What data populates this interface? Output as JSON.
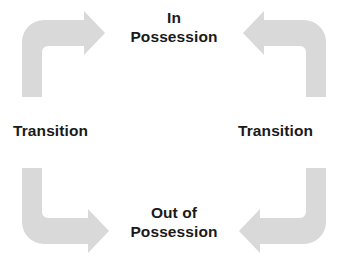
{
  "diagram": {
    "type": "cycle-diagram",
    "background_color": "#ffffff",
    "arrow_color": "#d9d9d9",
    "text_color": "#1a1a1a",
    "nodes": [
      {
        "id": "in-possession",
        "label": "In\nPossession",
        "position": "top-center"
      },
      {
        "id": "transition-right",
        "label": "Transition",
        "position": "middle-right"
      },
      {
        "id": "out-of-possession",
        "label": "Out of\nPossession",
        "position": "bottom-center"
      },
      {
        "id": "transition-left",
        "label": "Transition",
        "position": "middle-left"
      }
    ],
    "arrows": [
      {
        "id": "arrow-top-left",
        "from": "transition-left",
        "to": "in-possession",
        "direction": "up-then-right",
        "head": "right"
      },
      {
        "id": "arrow-top-right",
        "from": "transition-right",
        "to": "in-possession",
        "direction": "up-then-left",
        "head": "left"
      },
      {
        "id": "arrow-bottom-left",
        "from": "transition-left",
        "to": "out-of-possession",
        "direction": "down-then-right",
        "head": "right"
      },
      {
        "id": "arrow-bottom-right",
        "from": "transition-right",
        "to": "out-of-possession",
        "direction": "down-then-left",
        "head": "left"
      }
    ]
  }
}
